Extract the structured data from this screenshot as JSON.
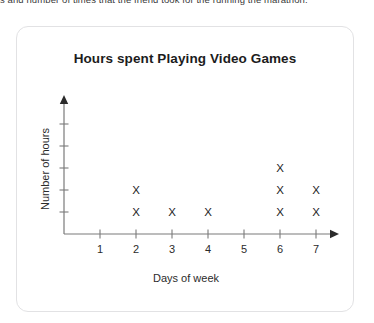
{
  "page": {
    "top_fragment": "s and number of times that the friend took for the running the marathon."
  },
  "chart_data": {
    "type": "scatter",
    "plot_style": "dot-plot-x-marks",
    "title": "Hours spent Playing Video Games",
    "xlabel": "Days of week",
    "ylabel": "Number of hours",
    "categories": [
      "1",
      "2",
      "3",
      "4",
      "5",
      "6",
      "7"
    ],
    "values": [
      0,
      2,
      1,
      1,
      0,
      3,
      2
    ],
    "marker": "X",
    "xlim": [
      0,
      7
    ],
    "ylim": [
      0,
      5
    ],
    "x_tick_labels": [
      "1",
      "2",
      "3",
      "4",
      "5",
      "6",
      "7"
    ],
    "y_tick_labels": [
      "",
      "",
      "",
      "",
      ""
    ],
    "y_tick_count": 5,
    "grid": false,
    "legend": false,
    "x_axis_arrow": true,
    "y_axis_arrow": true,
    "axis_color": "#7a7a7a",
    "marker_color": "#1c1c1c",
    "title_color": "#1c1c1c",
    "card_border_color": "#e2e2e4",
    "background_color": "#ffffff"
  }
}
